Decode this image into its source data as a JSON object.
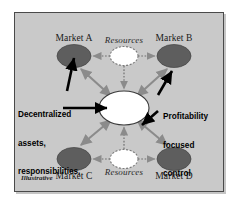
{
  "figure": {
    "caption": "Illustrative",
    "background_color": "#c9c9c9",
    "border_color": "#4a4a4a"
  },
  "center_node": {
    "name": "hub",
    "fill": "#ffffff",
    "stroke": "#3a3a3a",
    "label": ""
  },
  "markets": [
    {
      "id": "market-a",
      "label": "Market A",
      "position": "top-left",
      "fill": "#5e5e5e"
    },
    {
      "id": "market-b",
      "label": "Market B",
      "position": "top-right",
      "fill": "#5e5e5e"
    },
    {
      "id": "market-c",
      "label": "Market C",
      "position": "bottom-left",
      "fill": "#5e5e5e"
    },
    {
      "id": "market-d",
      "label": "Market D",
      "position": "bottom-right",
      "fill": "#5e5e5e"
    }
  ],
  "resource_nodes": [
    {
      "id": "resources-top",
      "label": "Resources",
      "position": "top-center",
      "fill": "#ffffff"
    },
    {
      "id": "resources-bottom",
      "label": "Resources",
      "position": "bottom-center",
      "fill": "#ffffff"
    }
  ],
  "annotations": [
    {
      "id": "decentralized-annotation",
      "text": "Decentralized\nassets,\nresponsibilities,\nand authority",
      "lines": [
        "Decentralized",
        "assets,",
        "responsibilities,",
        "and authority"
      ],
      "arrow_targets": [
        "market-a",
        "hub"
      ],
      "arrow_color": "#000000"
    },
    {
      "id": "profitability-annotation",
      "text": "Profitability\nfocused\ncontrol\nsystems",
      "lines": [
        "Profitability",
        "focused",
        "control",
        "systems"
      ],
      "arrow_targets": [
        "market-b",
        "hub"
      ],
      "arrow_color": "#000000"
    }
  ],
  "connections": {
    "hub_to_markets": {
      "style": "double-headed solid",
      "color": "#8b8b8b",
      "pairs": [
        "hub-market-a",
        "hub-market-b",
        "hub-market-c",
        "hub-market-d"
      ]
    },
    "resources_links": {
      "style": "dotted arrow",
      "color": "#8b8b8b",
      "pairs": [
        "resources-top-market-a",
        "resources-top-market-b",
        "resources-top-hub",
        "resources-bottom-market-c",
        "resources-bottom-market-d",
        "resources-bottom-hub"
      ]
    }
  }
}
